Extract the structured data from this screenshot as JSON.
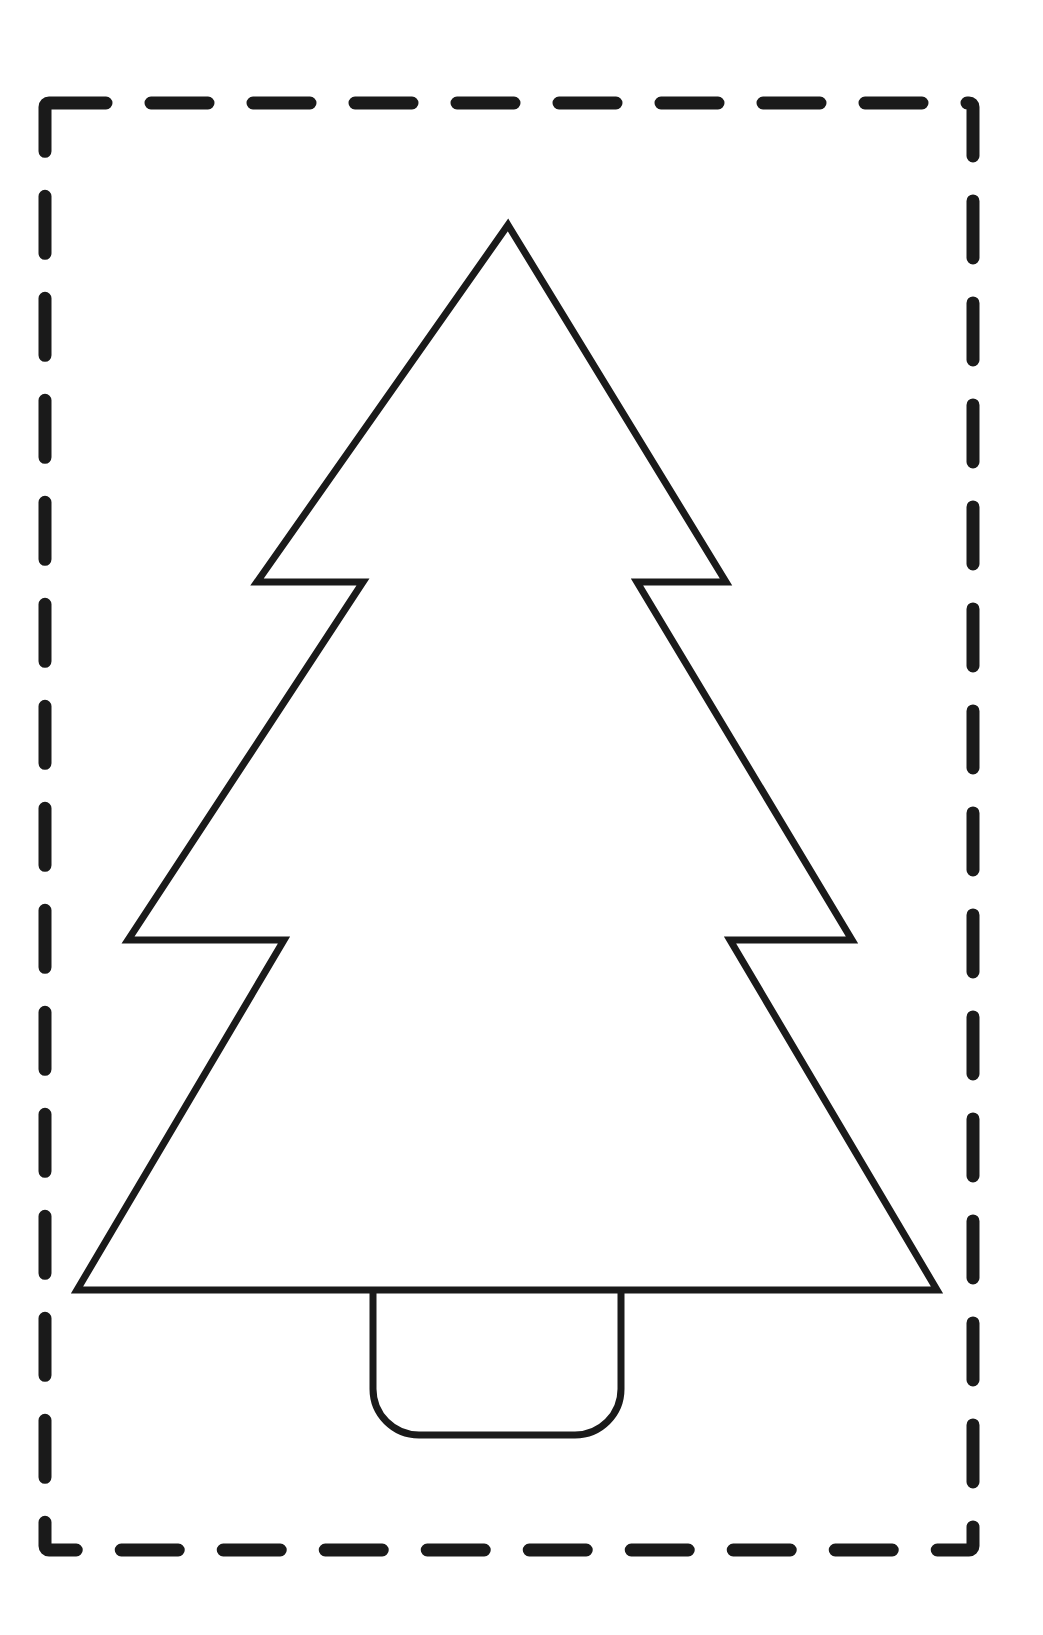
{
  "page": {
    "width": 1043,
    "height": 1635,
    "background_color": "#ffffff"
  },
  "cut_border": {
    "name": "dashed cutting guide",
    "shape": "rectangle",
    "stroke_color": "#1a1a1a",
    "stroke_width": 13,
    "dash_length": 57,
    "dash_gap": 45,
    "line_cap": "round",
    "corner_radius": 4,
    "x": 45,
    "y": 103,
    "width": 928,
    "height": 1447
  },
  "tree": {
    "name": "christmas tree outline",
    "stroke_color": "#1a1a1a",
    "stroke_width": 7,
    "fill_color": "#ffffff",
    "apex_x": 508,
    "apex_y": 225,
    "base_left_x": 77,
    "base_right_x": 937,
    "base_y": 1290,
    "tiers": 3,
    "points": "508,225 726,582 637,582 852,940 730,940 937,1290 77,1290 284,940 128,940 363,582 257,582"
  },
  "trunk": {
    "name": "tree trunk",
    "stroke_color": "#1a1a1a",
    "stroke_width": 7,
    "fill_color": "#ffffff",
    "x": 373,
    "y": 1290,
    "width": 248,
    "height": 145,
    "corner_radius_bottom": 46,
    "corner_radius_top": 0
  }
}
